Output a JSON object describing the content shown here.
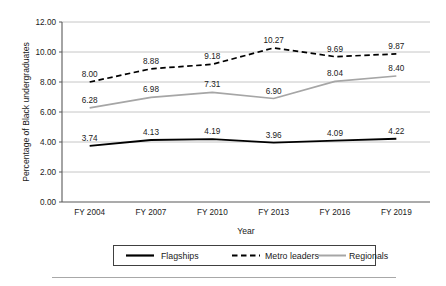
{
  "chart_data": {
    "type": "line",
    "title": "",
    "xlabel": "Year",
    "ylabel": "Percentage of Black undergraduates",
    "categories": [
      "FY 2004",
      "FY 2007",
      "FY 2010",
      "FY 2013",
      "FY 2016",
      "FY 2019"
    ],
    "ylim": [
      0.0,
      12.0
    ],
    "yticks": [
      "0.00",
      "2.00",
      "4.00",
      "6.00",
      "8.00",
      "10.00",
      "12.00"
    ],
    "ytick_values": [
      0,
      2,
      4,
      6,
      8,
      10,
      12
    ],
    "grid": true,
    "legend_position": "bottom",
    "data_labels": true,
    "series": [
      {
        "name": "Flagships",
        "style": "solid",
        "color": "#000000",
        "width": 1.9,
        "values": [
          3.74,
          4.13,
          4.19,
          3.96,
          4.09,
          4.22
        ],
        "labels": [
          "3.74",
          "4.13",
          "4.19",
          "3.96",
          "4.09",
          "4.22"
        ]
      },
      {
        "name": "Metro leaders",
        "style": "dashed",
        "color": "#000000",
        "width": 1.7,
        "values": [
          8.0,
          8.88,
          9.18,
          10.27,
          9.69,
          9.87
        ],
        "labels": [
          "8.00",
          "8.88",
          "9.18",
          "10.27",
          "9.69",
          "9.87"
        ]
      },
      {
        "name": "Regionals",
        "style": "solid",
        "color": "#a6a6a6",
        "width": 1.7,
        "values": [
          6.28,
          6.98,
          7.31,
          6.9,
          8.04,
          8.4
        ],
        "labels": [
          "6.28",
          "6.98",
          "7.31",
          "6.90",
          "8.04",
          "8.40"
        ]
      }
    ]
  },
  "legend": {
    "items": [
      {
        "label": "Flagships",
        "swatch": "solid-black-line-icon"
      },
      {
        "label": "Metro leaders",
        "swatch": "dashed-black-line-icon"
      },
      {
        "label": "Regionals",
        "swatch": "solid-gray-line-icon"
      }
    ]
  },
  "colors": {
    "flagships": "#000000",
    "metro_leaders": "#000000",
    "regionals": "#a6a6a6",
    "gridline": "#bfbfbf",
    "axis": "#595959",
    "text": "#1a1a1a",
    "footer_rule": "#a8a8a8"
  }
}
